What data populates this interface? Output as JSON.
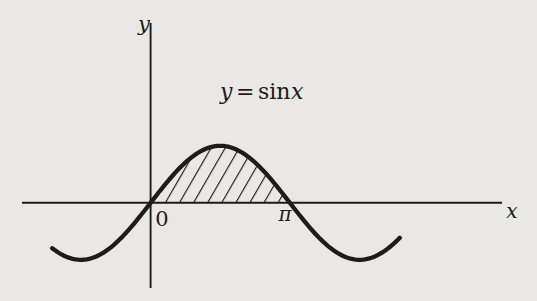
{
  "colors": {
    "ink": "#1d1c1a",
    "paper": "#f2f1ed"
  },
  "labels": {
    "y_axis": "y",
    "x_axis": "x",
    "origin": "0",
    "pi": "π"
  },
  "equation": {
    "lhs": "y",
    "equals": "=",
    "func": "sin",
    "arg": "x"
  },
  "chart_data": {
    "type": "line",
    "title": "y = sin x",
    "xlabel": "x",
    "ylabel": "y",
    "grid": false,
    "legend": false,
    "series": [
      {
        "name": "y = sin x",
        "function": "y = sin(x)",
        "x_domain_rad": [
          -2.22,
          5.62
        ],
        "amplitude": 1
      }
    ],
    "x_ticks": [
      {
        "value_rad": 0,
        "label": "0"
      },
      {
        "value_rad": 3.14159265,
        "label": "π"
      }
    ],
    "key_points": [
      {
        "x_rad": 0,
        "y": 0
      },
      {
        "x_rad": 1.5707963,
        "y": 1
      },
      {
        "x_rad": 3.14159265,
        "y": 0
      },
      {
        "x_rad": 4.71238898,
        "y": -1
      }
    ],
    "shaded_region": {
      "from_rad": 0,
      "to_rad": 3.14159265,
      "style": "diagonal-hatch",
      "description": "area under y = sin x between 0 and π"
    }
  }
}
